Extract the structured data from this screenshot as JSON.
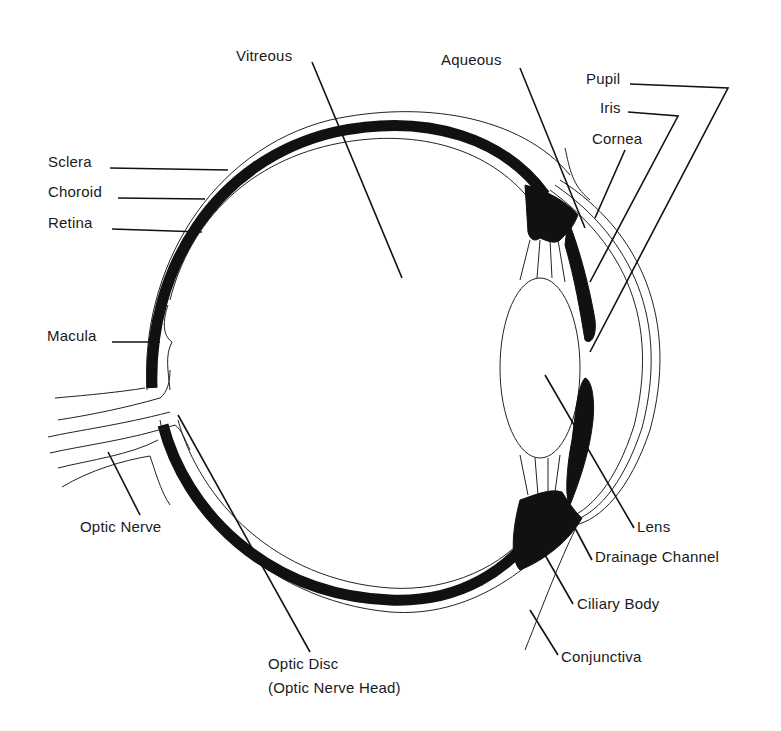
{
  "diagram": {
    "labels": {
      "vitreous": "Vitreous",
      "aqueous": "Aqueous",
      "pupil": "Pupil",
      "iris": "Iris",
      "cornea": "Cornea",
      "sclera": "Sclera",
      "choroid": "Choroid",
      "retina": "Retina",
      "macula": "Macula",
      "optic_nerve": "Optic Nerve",
      "optic_disc": "Optic Disc",
      "optic_disc_sub": "(Optic Nerve Head)",
      "lens": "Lens",
      "drainage_channel": "Drainage Channel",
      "ciliary_body": "Ciliary Body",
      "conjunctiva": "Conjunctiva"
    },
    "colors": {
      "background": "#ffffff",
      "ink": "#111111"
    }
  }
}
